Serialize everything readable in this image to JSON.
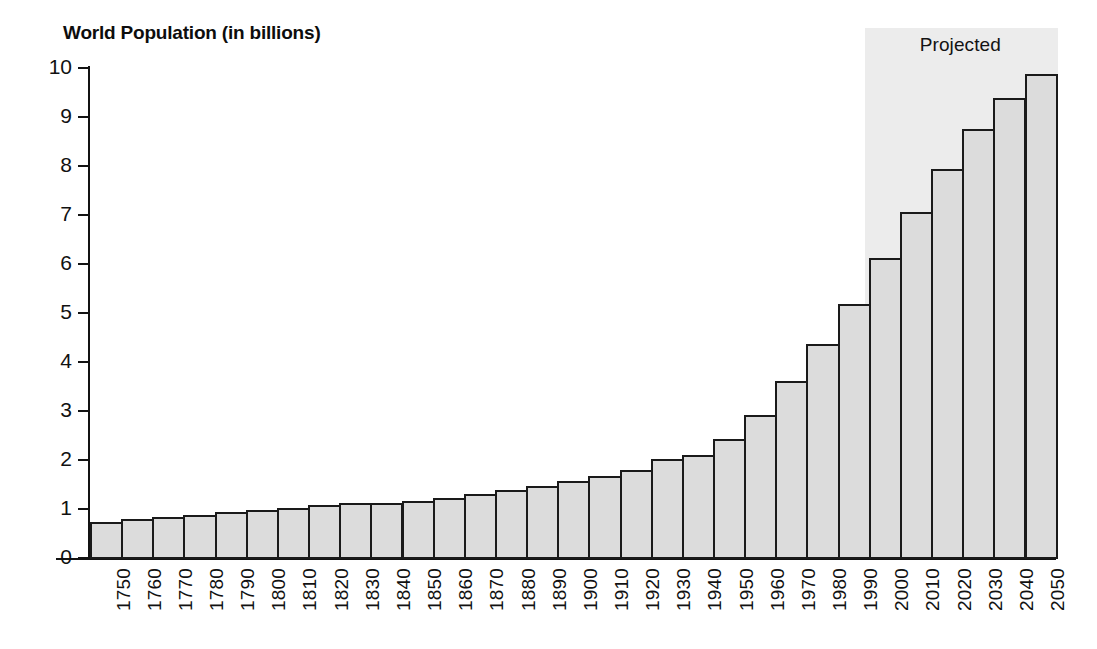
{
  "chart_data": {
    "type": "bar",
    "title": "World Population (in billions)",
    "xlabel": "",
    "ylabel": "",
    "ylim": [
      0,
      10
    ],
    "ytick_labels": [
      "10",
      "9",
      "8",
      "7",
      "6",
      "5",
      "4",
      "3",
      "2",
      "1",
      "0"
    ],
    "ytick_values": [
      10,
      9,
      8,
      7,
      6,
      5,
      4,
      3,
      2,
      1,
      0
    ],
    "grid": false,
    "legend": null,
    "categories": [
      "1750",
      "1760",
      "1770",
      "1780",
      "1790",
      "1800",
      "1810",
      "1820",
      "1830",
      "1840",
      "1850",
      "1860",
      "1870",
      "1880",
      "1890",
      "1900",
      "1910",
      "1920",
      "1930",
      "1940",
      "1950",
      "1960",
      "1970",
      "1980",
      "1990",
      "2000",
      "2010",
      "2020",
      "2030",
      "2040",
      "2050"
    ],
    "values": [
      0.76,
      0.81,
      0.86,
      0.9,
      0.95,
      1.0,
      1.05,
      1.1,
      1.15,
      1.14,
      1.19,
      1.24,
      1.33,
      1.4,
      1.49,
      1.6,
      1.7,
      1.81,
      2.04,
      2.13,
      2.44,
      2.93,
      3.63,
      4.39,
      5.21,
      6.15,
      7.08,
      7.95,
      8.78,
      9.4,
      9.9
    ],
    "annotations": [
      {
        "text": "Projected",
        "start_category": "2000",
        "end_category": "2050",
        "shade_color": "#ececec"
      }
    ],
    "bar_fill_color": "#dcdcdc",
    "bar_edge_color": "#1a1a1a",
    "background_color": "#ffffff"
  },
  "labels": {
    "projected": "Projected"
  }
}
